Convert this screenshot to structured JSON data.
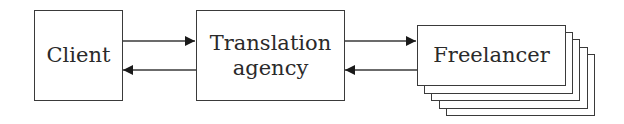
{
  "diagram": {
    "nodes": [
      {
        "id": "client",
        "label": "Client"
      },
      {
        "id": "agency",
        "label_line1": "Translation",
        "label_line2": "agency"
      },
      {
        "id": "freelancer",
        "label": "Freelancer",
        "stacked_copies": 4
      }
    ],
    "edges": [
      {
        "from": "client",
        "to": "agency",
        "direction": "forward"
      },
      {
        "from": "agency",
        "to": "client",
        "direction": "backward"
      },
      {
        "from": "agency",
        "to": "freelancer",
        "direction": "forward"
      },
      {
        "from": "freelancer",
        "to": "agency",
        "direction": "backward"
      }
    ],
    "colors": {
      "stroke": "#3a3a3a",
      "text": "#2a2a2a",
      "background": "#ffffff"
    }
  }
}
